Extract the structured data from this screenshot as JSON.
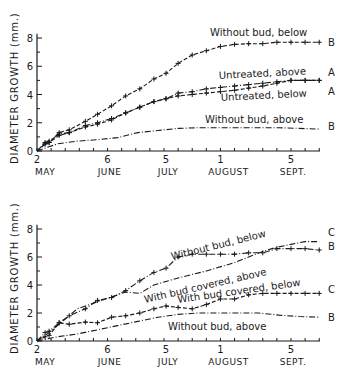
{
  "chart_data": [
    {
      "type": "line",
      "title": "",
      "xlabel": "",
      "ylabel": "DIAMETER GROWTH (mm.)",
      "ylim": [
        0,
        8
      ],
      "yticks": [
        0,
        2,
        4,
        6,
        8
      ],
      "grid": false,
      "x_tick_labels": [
        {
          "day": "2",
          "month": "MAY"
        },
        {
          "day": "6",
          "month": "JUNE"
        },
        {
          "day": "5",
          "month": "JULY"
        },
        {
          "day": "1",
          "month": "AUGUST"
        },
        {
          "day": "5",
          "month": "SEPT."
        }
      ],
      "x_days_from_may2": [
        0,
        35,
        64,
        91,
        126
      ],
      "series": [
        {
          "name": "Without bud, below",
          "significance": "B",
          "style": "dashed-plus",
          "x": [
            0,
            4,
            6,
            11,
            16,
            24,
            30,
            37,
            44,
            51,
            58,
            64,
            70,
            77,
            84,
            91,
            98,
            105,
            112,
            119,
            126,
            133,
            140
          ],
          "values": [
            0,
            0.5,
            0.6,
            1.3,
            1.5,
            2.1,
            2.6,
            3.2,
            3.9,
            4.4,
            5.1,
            5.5,
            6.2,
            6.8,
            7.1,
            7.4,
            7.55,
            7.6,
            7.6,
            7.7,
            7.7,
            7.7,
            7.7
          ]
        },
        {
          "name": "Untreated, above",
          "significance": "A",
          "style": "dash-dot-plus",
          "x": [
            0,
            4,
            6,
            11,
            16,
            24,
            30,
            37,
            44,
            51,
            58,
            64,
            70,
            77,
            84,
            91,
            98,
            105,
            112,
            119,
            126,
            133,
            140
          ],
          "values": [
            0,
            0.6,
            0.7,
            1.2,
            1.3,
            1.8,
            2.0,
            2.3,
            2.7,
            3.1,
            3.5,
            3.7,
            4.1,
            4.2,
            4.4,
            4.5,
            4.6,
            4.7,
            4.8,
            4.9,
            5.0,
            5.0,
            5.0
          ]
        },
        {
          "name": "Untreated, below",
          "significance": "A",
          "style": "dashed-plus",
          "x": [
            0,
            4,
            6,
            11,
            16,
            24,
            30,
            37,
            44,
            51,
            58,
            64,
            70,
            77,
            84,
            91,
            98,
            105,
            112,
            119,
            126,
            133,
            140
          ],
          "values": [
            0,
            0.5,
            0.6,
            1.1,
            1.3,
            1.7,
            1.9,
            2.2,
            2.7,
            3.1,
            3.5,
            3.7,
            3.9,
            4.0,
            4.1,
            4.2,
            4.3,
            4.45,
            4.6,
            4.8,
            5.0,
            5.0,
            5.0
          ]
        },
        {
          "name": "Without bud, above",
          "significance": "B",
          "style": "dash-dot",
          "x": [
            0,
            10,
            20,
            30,
            40,
            50,
            60,
            70,
            80,
            91,
            100,
            110,
            120,
            130,
            140
          ],
          "values": [
            0,
            0.5,
            0.7,
            0.8,
            0.95,
            1.3,
            1.45,
            1.6,
            1.65,
            1.65,
            1.65,
            1.65,
            1.65,
            1.6,
            1.55
          ]
        }
      ]
    },
    {
      "type": "line",
      "title": "",
      "xlabel": "",
      "ylabel": "DIAMETER GROWTH (mm.)",
      "ylim": [
        0,
        8
      ],
      "yticks": [
        0,
        2,
        4,
        6,
        8
      ],
      "grid": false,
      "x_tick_labels": [
        {
          "day": "2",
          "month": "MAY"
        },
        {
          "day": "6",
          "month": "JUNE"
        },
        {
          "day": "5",
          "month": "JULY"
        },
        {
          "day": "1",
          "month": "AUGUST"
        },
        {
          "day": "5",
          "month": "SEPT."
        }
      ],
      "x_days_from_may2": [
        0,
        35,
        64,
        91,
        126
      ],
      "series": [
        {
          "name": "Without bud, below",
          "significance": "B",
          "style": "dash-dot-plus",
          "x": [
            0,
            4,
            6,
            11,
            16,
            24,
            30,
            37,
            44,
            51,
            58,
            64,
            70,
            77,
            84,
            91,
            98,
            105,
            112,
            119,
            126,
            133,
            140
          ],
          "values": [
            0,
            0.6,
            0.7,
            1.3,
            1.8,
            2.3,
            2.9,
            3.1,
            3.6,
            4.3,
            4.9,
            5.2,
            6.0,
            6.2,
            6.2,
            6.2,
            6.2,
            6.3,
            6.3,
            6.6,
            6.6,
            6.6,
            6.5
          ]
        },
        {
          "name": "With bud covered, above",
          "significance": "C",
          "style": "dash-dot",
          "x": [
            0,
            6,
            11,
            20,
            30,
            44,
            51,
            58,
            70,
            84,
            98,
            112,
            119,
            126,
            133,
            140
          ],
          "values": [
            0,
            0.6,
            1.2,
            2.3,
            2.8,
            3.5,
            3.4,
            4.0,
            4.5,
            5.0,
            5.6,
            6.4,
            6.7,
            6.9,
            7.1,
            7.1
          ]
        },
        {
          "name": "With bud covered, below",
          "significance": "C",
          "style": "dashed-plus",
          "x": [
            0,
            4,
            6,
            11,
            16,
            24,
            30,
            37,
            44,
            51,
            58,
            64,
            70,
            77,
            84,
            91,
            98,
            105,
            112,
            119,
            126,
            133,
            140
          ],
          "values": [
            0,
            0.3,
            0.4,
            1.3,
            1.2,
            1.35,
            1.3,
            1.7,
            1.8,
            2.0,
            2.3,
            2.5,
            2.4,
            2.3,
            2.6,
            3.0,
            3.0,
            3.3,
            3.4,
            3.4,
            3.4,
            3.4,
            3.4
          ]
        },
        {
          "name": "Without bud, above",
          "significance": "B",
          "style": "dash-dot",
          "x": [
            0,
            10,
            20,
            30,
            40,
            50,
            60,
            70,
            80,
            91,
            100,
            110,
            120,
            130,
            140
          ],
          "values": [
            0,
            0.3,
            0.5,
            0.8,
            1.1,
            1.4,
            1.7,
            1.9,
            2.0,
            2.0,
            2.0,
            2.0,
            1.85,
            1.75,
            1.7
          ]
        }
      ]
    }
  ],
  "panels": [
    {
      "ylabel": "DIAMETER GROWTH (mm.)",
      "yticks": [
        "0",
        "2",
        "4",
        "6",
        "8"
      ],
      "x_days": [
        "2",
        "6",
        "5",
        "1",
        "5"
      ],
      "x_months": [
        "MAY",
        "JUNE",
        "JULY",
        "AUGUST",
        "SEPT."
      ],
      "labels": [
        {
          "text": "Without bud, below",
          "sig": "B"
        },
        {
          "text": "Untreated, above",
          "sig": "A"
        },
        {
          "text": "Untreated, below",
          "sig": "A"
        },
        {
          "text": "Without bud, above",
          "sig": "B"
        }
      ]
    },
    {
      "ylabel": "DIAMETER GROWTH (mm.)",
      "yticks": [
        "0",
        "2",
        "4",
        "6",
        "8"
      ],
      "x_days": [
        "2",
        "6",
        "5",
        "1",
        "5"
      ],
      "x_months": [
        "MAY",
        "JUNE",
        "JULY",
        "AUGUST",
        "SEPT."
      ],
      "labels": [
        {
          "text": "Without bud, below",
          "sig": "B"
        },
        {
          "text": "With bud covered, above",
          "sig": "C"
        },
        {
          "text": "With bud covered, below",
          "sig": "C"
        },
        {
          "text": "Without bud, above",
          "sig": "B"
        }
      ]
    }
  ]
}
